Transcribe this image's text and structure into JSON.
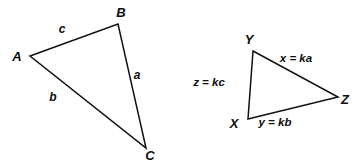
{
  "figure": {
    "background_color": "#ffffff",
    "stroke_color": "#111111",
    "text_color": "#0d0d0d"
  },
  "triangle_left": {
    "name": "triangle-abc",
    "vertices": [
      {
        "label": "A",
        "x": 30,
        "y": 56,
        "label_x": 17,
        "label_y": 61
      },
      {
        "label": "B",
        "x": 118,
        "y": 24,
        "label_x": 121,
        "label_y": 17
      },
      {
        "label": "C",
        "x": 146,
        "y": 148,
        "label_x": 150,
        "label_y": 160
      }
    ],
    "sides": [
      {
        "label": "c",
        "label_x": 62,
        "label_y": 33
      },
      {
        "label": "a",
        "label_x": 137,
        "label_y": 79
      },
      {
        "label": "b",
        "label_x": 53,
        "label_y": 101
      }
    ]
  },
  "triangle_right": {
    "name": "triangle-xyz",
    "vertices": [
      {
        "label": "Y",
        "x": 253,
        "y": 51,
        "label_x": 249,
        "label_y": 44
      },
      {
        "label": "Z",
        "x": 338,
        "y": 97,
        "label_x": 345,
        "label_y": 104
      },
      {
        "label": "X",
        "x": 248,
        "y": 119,
        "label_x": 234,
        "label_y": 128
      }
    ],
    "sides": [
      {
        "label": "x = ka",
        "label_x": 296,
        "label_y": 62
      },
      {
        "label": "y = kb",
        "label_x": 275,
        "label_y": 126
      },
      {
        "label": "z = kc",
        "label_x": 209,
        "label_y": 86
      }
    ]
  }
}
